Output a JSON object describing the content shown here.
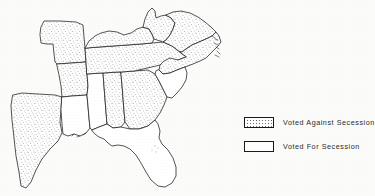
{
  "figure": {
    "kind": "thematic-map",
    "background_color": "#fbfbfa",
    "line_color": "#1c1c1c"
  },
  "legend": {
    "entries": [
      {
        "label": "Voted Against Secession",
        "pattern": "stipple",
        "swatch_fill": "#ffffff"
      },
      {
        "label": "Voted For Secession",
        "pattern": "plain",
        "swatch_fill": "#ffffff"
      }
    ]
  },
  "map": {
    "states": [
      {
        "name": "Missouri",
        "vote": "against"
      },
      {
        "name": "Arkansas",
        "vote": "against"
      },
      {
        "name": "Texas",
        "vote": "against"
      },
      {
        "name": "Louisiana",
        "vote": "for"
      },
      {
        "name": "Mississippi",
        "vote": "for"
      },
      {
        "name": "Alabama",
        "vote": "against"
      },
      {
        "name": "Georgia",
        "vote": "against"
      },
      {
        "name": "Florida",
        "vote": "for"
      },
      {
        "name": "Tennessee",
        "vote": "against"
      },
      {
        "name": "Kentucky",
        "vote": "against"
      },
      {
        "name": "West Virginia",
        "vote": "against"
      },
      {
        "name": "Virginia",
        "vote": "against"
      },
      {
        "name": "North Carolina",
        "vote": "against"
      },
      {
        "name": "South Carolina",
        "vote": "for"
      }
    ]
  }
}
